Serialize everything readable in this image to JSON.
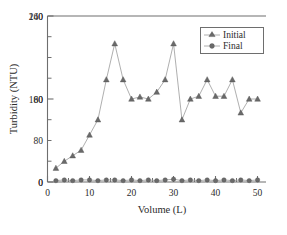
{
  "chart_data": {
    "type": "line",
    "title": "",
    "xlabel": "Volume (L)",
    "ylabel": "Turbidity (NTU)",
    "xlim": [
      0,
      52
    ],
    "ylim": [
      0,
      240
    ],
    "xticks": [
      0,
      10,
      20,
      30,
      40,
      50
    ],
    "xtick_labels": [
      "0",
      "10",
      "20",
      "30",
      "40",
      "50"
    ],
    "xminor_ticks": [
      5,
      15,
      25,
      35,
      45
    ],
    "yticks": [
      0,
      80,
      160,
      240
    ],
    "ytick_labels": [
      "0",
      "80",
      "160",
      "240"
    ],
    "yminor_ticks": [
      40,
      120,
      200
    ],
    "grid": false,
    "legend_position": "top-right",
    "x": [
      2,
      4,
      6,
      8,
      10,
      12,
      14,
      16,
      18,
      20,
      22,
      24,
      26,
      28,
      30,
      32,
      34,
      36,
      38,
      40,
      42,
      44,
      46,
      48,
      50
    ],
    "series": [
      {
        "name": "Initial",
        "marker": "triangle",
        "color": "#6a6a6a",
        "values": [
          20,
          30,
          38,
          46,
          68,
          90,
          148,
          200,
          148,
          120,
          123,
          120,
          130,
          148,
          200,
          90,
          120,
          124,
          148,
          124,
          124,
          148,
          100,
          120,
          120
        ]
      },
      {
        "name": "Final",
        "marker": "circle",
        "color": "#6a6a6a",
        "values": [
          2,
          3,
          2,
          3,
          3,
          2,
          3,
          3,
          2,
          3,
          2,
          3,
          2,
          3,
          4,
          2,
          3,
          2,
          3,
          2,
          3,
          2,
          3,
          2,
          3
        ]
      }
    ]
  },
  "legend": {
    "entries": [
      {
        "label": "Initial"
      },
      {
        "label": "Final"
      }
    ]
  }
}
